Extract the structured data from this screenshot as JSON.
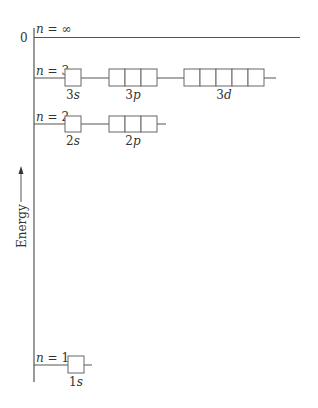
{
  "diagram": {
    "axis": {
      "label": "Energy",
      "zero_label": "0",
      "direction": "up"
    },
    "levels": [
      {
        "id": "n-inf",
        "label_n": "n",
        "label_eq": " = ∞",
        "subshells": []
      },
      {
        "id": "n3",
        "label_n": "n",
        "label_eq": " = 3",
        "subshells": [
          {
            "name": "3s",
            "num": "3",
            "letter": "s",
            "orbitals": 1
          },
          {
            "name": "3p",
            "num": "3",
            "letter": "p",
            "orbitals": 3
          },
          {
            "name": "3d",
            "num": "3",
            "letter": "d",
            "orbitals": 5
          }
        ]
      },
      {
        "id": "n2",
        "label_n": "n",
        "label_eq": " = 2",
        "subshells": [
          {
            "name": "2s",
            "num": "2",
            "letter": "s",
            "orbitals": 1
          },
          {
            "name": "2p",
            "num": "2",
            "letter": "p",
            "orbitals": 3
          }
        ]
      },
      {
        "id": "n1",
        "label_n": "n",
        "label_eq": " = 1",
        "subshells": [
          {
            "name": "1s",
            "num": "1",
            "letter": "s",
            "orbitals": 1
          }
        ]
      }
    ]
  }
}
